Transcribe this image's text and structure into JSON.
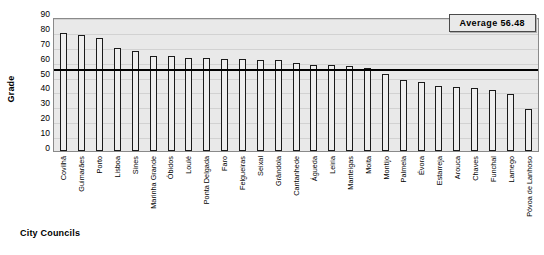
{
  "chart_data": {
    "type": "bar",
    "title": "",
    "xlabel": "City Councils",
    "ylabel": "Grade",
    "ylim": [
      0,
      90
    ],
    "ytick_step": 10,
    "yticks": [
      90,
      80,
      70,
      60,
      50,
      40,
      30,
      20,
      10,
      0
    ],
    "grid": true,
    "legend": "none",
    "categories": [
      "Covilhã",
      "Guimarães",
      "Porto",
      "Lisboa",
      "Sines",
      "Marinha Grande",
      "Óbidos",
      "Loulé",
      "Ponta Delgada",
      "Faro",
      "Felgueiras",
      "Seixal",
      "Grândola",
      "Cantanhede",
      "Águeda",
      "Leiria",
      "Manteigas",
      "Moita",
      "Montijo",
      "Palmela",
      "Évora",
      "Estarreja",
      "Arouca",
      "Chaves",
      "Funchal",
      "Lamego",
      "Póvoa de Lanhoso"
    ],
    "values": [
      79,
      78,
      76,
      69.5,
      67,
      63.5,
      63.5,
      62.5,
      62.5,
      62,
      61.5,
      61,
      61,
      59,
      57.5,
      57.5,
      57,
      55.5,
      52,
      48,
      46.5,
      44,
      43,
      42.5,
      41,
      38,
      28
    ],
    "annotations": [
      {
        "name": "average-line",
        "label": "Average 56.48",
        "value": 56.48,
        "type": "horizontal-line"
      }
    ],
    "bar_fill": "#eeeeee",
    "bar_border": "#1a1a1a",
    "plot_background": "#e9e9e9"
  },
  "axes": {
    "y_title": "Grade",
    "x_title": "City Councils"
  },
  "average_box": {
    "text": "Average 56.48"
  }
}
